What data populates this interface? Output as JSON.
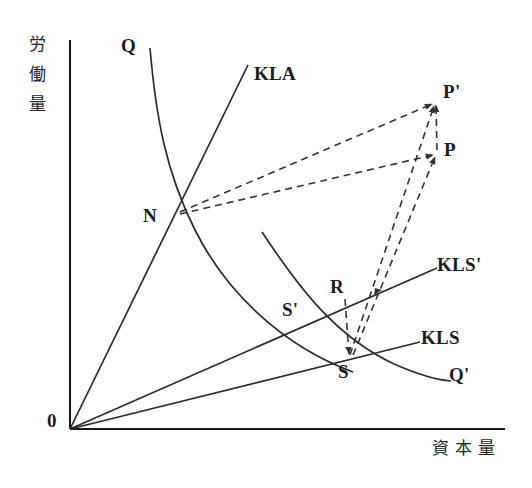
{
  "figure": {
    "type": "economics-isoquant-diagram",
    "axes": {
      "y_label": "労働量",
      "y_label_chars": [
        "労",
        "働",
        "量"
      ],
      "x_label": "資本量",
      "origin_label": "0",
      "y_axis": {
        "x": 70,
        "y_top": 40,
        "y_bottom": 429
      },
      "x_axis": {
        "y": 429,
        "x_left": 70,
        "x_right": 505
      }
    },
    "curve_labels": {
      "q": "Q",
      "q_prime": "Q'",
      "kla": "KLA",
      "kls": "KLS",
      "kls_prime": "KLS'"
    },
    "point_labels": {
      "n": "N",
      "r": "R",
      "s": "S",
      "s_prime": "S'",
      "p": "P",
      "p_prime": "P'"
    },
    "label_positions": {
      "q": {
        "x": 121,
        "y": 36
      },
      "kla": {
        "x": 254,
        "y": 64
      },
      "p_prime": {
        "x": 443,
        "y": 82
      },
      "p": {
        "x": 444,
        "y": 140
      },
      "n": {
        "x": 143,
        "y": 206
      },
      "kls_prime": {
        "x": 437,
        "y": 255
      },
      "r": {
        "x": 330,
        "y": 277
      },
      "s_prime": {
        "x": 282,
        "y": 300
      },
      "kls": {
        "x": 421,
        "y": 328
      },
      "s": {
        "x": 338,
        "y": 362
      },
      "q_prime": {
        "x": 449,
        "y": 365
      },
      "origin": {
        "x": 47,
        "y": 411
      }
    },
    "geometry": {
      "points": {
        "O": [
          70,
          429
        ],
        "N": [
          179,
          207
        ],
        "S_prime": [
          296,
          330
        ],
        "S": [
          349,
          358
        ],
        "R": [
          346,
          303
        ],
        "P": [
          437,
          153
        ],
        "P_prime": [
          436,
          101
        ],
        "arrow_on_kls_prime": [
          379,
          292
        ]
      },
      "solid_lines": [
        {
          "name": "KLA-ray",
          "from": [
            70,
            429
          ],
          "to": [
            248,
            65
          ]
        },
        {
          "name": "KLS-prime-ray",
          "from": [
            70,
            429
          ],
          "to": [
            437,
            268
          ]
        },
        {
          "name": "KLS-ray",
          "from": [
            70,
            429
          ],
          "to": [
            420,
            342
          ]
        }
      ],
      "solid_curves": [
        {
          "name": "Q-isoquant",
          "path": "M150,48 C157,120 168,175 196,232 C226,292 280,346 352,372"
        },
        {
          "name": "Q-prime-isoquant",
          "path": "M262,232 C300,290 336,338 395,365 C418,375 436,380 451,381"
        }
      ],
      "dashed_lines": [
        {
          "name": "N-to-P-prime",
          "from": [
            180,
            212
          ],
          "to": [
            434,
            103
          ],
          "arrow": true
        },
        {
          "name": "N-to-P",
          "from": [
            180,
            214
          ],
          "to": [
            435,
            155
          ],
          "arrow": true
        },
        {
          "name": "S-to-P-prime",
          "from": [
            350,
            356
          ],
          "to": [
            434,
            104
          ],
          "arrow": true
        },
        {
          "name": "S-to-P",
          "from": [
            352,
            356
          ],
          "to": [
            435,
            156
          ],
          "arrow": true
        },
        {
          "name": "P-to-P-prime-vertical",
          "from": [
            437,
            150
          ],
          "to": [
            436,
            104
          ]
        },
        {
          "name": "R-to-S-vertical",
          "from": [
            345,
            300
          ],
          "to": [
            349,
            355
          ],
          "arrow": true
        }
      ]
    },
    "stroke_colors": {
      "axis": "#1a1a1a",
      "curve": "#2b2b2b",
      "dashed": "#333333"
    }
  }
}
